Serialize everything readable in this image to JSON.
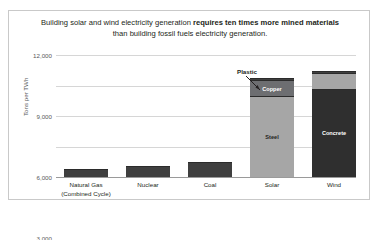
{
  "title": {
    "line1_normal": "Building solar and wind electricity generation ",
    "line1_bold": "requires ten times more mined materials",
    "line2": "than building fossil fuels electricity generation."
  },
  "axes": {
    "ylabel": "Tons per TWh",
    "yticks": [
      "0",
      "3,000",
      "6,000",
      "9,000",
      "12,000"
    ]
  },
  "callout": {
    "label": "Plastic"
  },
  "colors": {
    "steel": "#a6a6a6",
    "copper": "#6d6e71",
    "plastic": "#3f3f3f",
    "concrete": "#2f2f2f",
    "small_bar": "#3f3f3f",
    "gridline": "#d6d6d6",
    "text": "#231f20"
  },
  "chart_data": {
    "type": "bar",
    "title": "Building solar and wind electricity generation requires ten times more mined materials than building fossil fuels electricity generation.",
    "xlabel": "",
    "ylabel": "Tons per TWh",
    "ylim": [
      0,
      12000
    ],
    "yticks": [
      0,
      3000,
      6000,
      9000,
      12000
    ],
    "grid": true,
    "legend": false,
    "stacked": true,
    "categories": [
      "Natural Gas (Combined Cycle)",
      "Nuclear",
      "Coal",
      "Solar",
      "Wind"
    ],
    "series": [
      {
        "name": "Steel",
        "values": [
          0,
          0,
          0,
          8000,
          0
        ],
        "color": "#a6a6a6"
      },
      {
        "name": "Copper",
        "values": [
          0,
          0,
          0,
          1500,
          0
        ],
        "color": "#6d6e71"
      },
      {
        "name": "Plastic",
        "values": [
          0,
          0,
          0,
          200,
          200
        ],
        "color": "#3f3f3f"
      },
      {
        "name": "Concrete",
        "values": [
          0,
          0,
          0,
          0,
          8700
        ],
        "color": "#2f2f2f"
      },
      {
        "name": "Other materials",
        "values": [
          800,
          1100,
          1500,
          0,
          1550
        ],
        "color": "#3f3f3f"
      }
    ],
    "totals": [
      800,
      1100,
      1500,
      9700,
      10450
    ]
  },
  "bars": [
    {
      "category_line1": "Natural Gas",
      "category_line2": "(Combined Cycle)",
      "left": 8,
      "width": 44,
      "segments": [
        {
          "label": "",
          "value": 800,
          "color": "#3f3f3f",
          "text_color": "#ffffff"
        }
      ]
    },
    {
      "category_line1": "Nuclear",
      "category_line2": "",
      "left": 70,
      "width": 44,
      "segments": [
        {
          "label": "",
          "value": 1100,
          "color": "#3f3f3f",
          "text_color": "#ffffff"
        }
      ]
    },
    {
      "category_line1": "Coal",
      "category_line2": "",
      "left": 132,
      "width": 44,
      "segments": [
        {
          "label": "",
          "value": 1500,
          "color": "#3f3f3f",
          "text_color": "#ffffff"
        }
      ]
    },
    {
      "category_line1": "Solar",
      "category_line2": "",
      "left": 194,
      "width": 44,
      "segments": [
        {
          "label": "Steel",
          "value": 8000,
          "color": "#a6a6a6",
          "text_color": "#231f20"
        },
        {
          "label": "Copper",
          "value": 1500,
          "color": "#6d6e71",
          "text_color": "#ffffff"
        },
        {
          "label": "",
          "value": 200,
          "color": "#3f3f3f",
          "text_color": "#ffffff"
        }
      ]
    },
    {
      "category_line1": "Wind",
      "category_line2": "",
      "left": 256,
      "width": 44,
      "segments": [
        {
          "label": "Concrete",
          "value": 8700,
          "color": "#2f2f2f",
          "text_color": "#ffffff"
        },
        {
          "label": "",
          "value": 1550,
          "color": "#a6a6a6",
          "text_color": "#231f20"
        },
        {
          "label": "",
          "value": 200,
          "color": "#3f3f3f",
          "text_color": "#ffffff"
        }
      ]
    }
  ]
}
